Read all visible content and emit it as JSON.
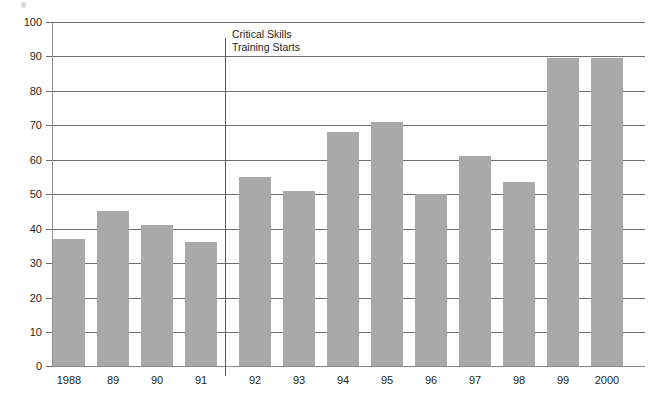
{
  "chart_data": {
    "type": "bar",
    "title": "",
    "subtitle": "",
    "xlabel": "",
    "ylabel": "",
    "categories": [
      "1988",
      "89",
      "90",
      "91",
      "92",
      "93",
      "94",
      "95",
      "96",
      "97",
      "98",
      "99",
      "2000"
    ],
    "values": [
      37,
      45,
      41,
      36,
      55,
      51,
      68,
      71,
      50,
      61,
      53.5,
      89.5,
      89.5
    ],
    "series": [
      {
        "name": "",
        "values": [
          37,
          45,
          41,
          36,
          55,
          51,
          68,
          71,
          50,
          61,
          53.5,
          89.5,
          89.5
        ]
      }
    ],
    "ylim": [
      0,
      100
    ],
    "ytick_values": [
      0,
      10,
      20,
      30,
      40,
      50,
      60,
      70,
      80,
      90,
      100
    ],
    "ytick_labels": [
      "0",
      "10",
      "20",
      "30",
      "40",
      "50",
      "60",
      "70",
      "80",
      "90",
      "100"
    ],
    "grid": "horizontal",
    "legend": "none",
    "bar_color": "#a9a9a9",
    "gridline_color": "#6e6e6e",
    "text_color": "#231f20",
    "annotations": [
      {
        "name": "critical-skills-marker",
        "line1": "Critical Skills",
        "line2": "Training Starts",
        "after_category": "91",
        "before_category": "92"
      }
    ]
  }
}
